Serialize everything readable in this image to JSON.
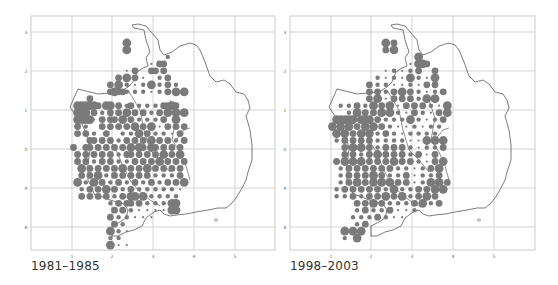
{
  "figure": {
    "panels": [
      {
        "id": "map-1981-1985",
        "caption": "1981–1985",
        "x_ticks": [
          "1",
          "2",
          "3",
          "4",
          "5"
        ],
        "y_ticks": [
          "3",
          "2",
          "1",
          "0",
          "9",
          "8"
        ]
      },
      {
        "id": "map-1998-2003",
        "caption": "1998–2003",
        "x_ticks": [
          "1",
          "2",
          "3",
          "4",
          "5"
        ],
        "y_ticks": [
          "3",
          "2",
          "1",
          "0",
          "9",
          "8"
        ]
      }
    ],
    "colors": {
      "dot": "#7a7a7a",
      "grid": "#c8c8c8",
      "outline": "#444444",
      "frame": "#bdbdbd",
      "tick_label": "#666666"
    },
    "legend_note": "Dot size indicates abundance class per grid square (0 none, 1 tiny, 2 small, 3 medium, 4 large)"
  },
  "chart_data": [
    {
      "type": "scatter",
      "title": "1981–1985",
      "xlabel": "",
      "ylabel": "",
      "x_ticks": [
        1,
        2,
        3,
        4,
        5
      ],
      "y_ticks": [
        "3",
        "2",
        "1",
        "0",
        "9",
        "8"
      ],
      "grid": true,
      "cell_size_px": 8.2,
      "origin_px": [
        53,
        36
      ],
      "rows": [
        "..................................",
        "..................4...............",
        "..................4...............",
        "............................2.....",
        "........................1.33......",
        "..................1.3...33.3......",
        "................3.4.3.1...2.3.....",
        "..............3.4.2.1.2.4.2.3.2...",
        "..............34332.2.2.1.2.3.4.4.",
        ".........3.........................",
        "......444443.44.3.23.2.2.2.3343...",
        "......444.3.2.3.3.4.3.3.2.3.4.4.4.",
        "......44441.3.33.4.3.2.2.2.3..4...",
        "......3.2...3.3.3.3.4.3.4.1.3.3.3.",
        "......3.3.2..3...2.2.4.3.2.2.1.3.",
        ".........33.3.3.2.3.3.3.4.3.3.2.3.",
        ".....3..33.3.3.3.3.4.43.43.3.3.3.",
        "......3.3.3.3.3.2.33.3.3.3.4.3.4.",
        "......3.3.2.3.3.2.2.3.3.3.4.3.3.3",
        ".......4.3.3.3.3.4.3.3.4.3.3.3.3.",
        ".......3.3.4.2.3.3.3.3.3.2.2.2.3.",
        "......4.2.4.3.2.3.2.3.2.3.2.3.3.4",
        ".......2.3.3.4.3.2.3.2.2.2.2.2.1.",
        ".......3.3.3.3.2.3.44.4.2.2.2.2.",
        "..............2.3.33.3.2.2.2.44.",
        "...............3.3.2.1.1.1.1.44.",
        "..............3.2.2.1.1.1.......",
        "...............3.2...............",
        "..............4.2.1..............",
        "..............2.2................",
        "..............4.1.1.............."
      ]
    },
    {
      "type": "scatter",
      "title": "1998–2003",
      "xlabel": "",
      "ylabel": "",
      "x_ticks": [
        1,
        2,
        3,
        4,
        5
      ],
      "y_ticks": [
        "3",
        "2",
        "1",
        "0",
        "9",
        "8"
      ],
      "grid": true,
      "cell_size_px": 8.2,
      "origin_px": [
        312,
        36
      ],
      "rows": [
        "..................................",
        "..................4.3.............",
        "..................3.4.............",
        "..........................4.......",
        "........................1.443.....",
        "..................1.2.1.2.3...3...",
        "................2.1.2.1.4.2.1.4...",
        "..............3.2.2.1.1.2.1.3.3...",
        "..............3.3.2.3.4.3.2.1.2.3.",
        "..............3.4.1.3.3.3.2.4.4...",
        ".......2.2.3.2.4.3.4.1.3.3.3.2.1.4.",
        ".........2.4.3.3.4.4.2.1.3.2.1.3.4",
        "......44444.444.3.2.2.2.4.2.1.2.3.",
        ".....4.4.4.3.4.4.3.2.1.1.2.1.2.2.",
        "......4.4.3.4.4.2.3.2.1.2.2.2.2.",
        "......2.3.3.3.3.2.2.2.2.1.1.4.4.4",
        "........3.4.4.3.2.3.3.3.2.1.2.2.3",
        "........3.3.2.3.4.3.3.3.2.3.1.3.",
        "......3.4.4.4.3.3.3.4.3.3.2.1.3.4",
        ".......2.3.3.3.3.3.3.2.2.1.2.3.4.",
        ".......2.3.3.3.4.3.2.2.3.1.2.2.3.",
        ".......2.3.4.3.4.4.4.3.3.1.2.4.4.3",
        "......2.3.3.3.3.3.2.4.2.2.3.3.4.4",
        "......2.2.3.2.3.3.4.3.4.2.3.4.3.",
        "...........3.3.4.3.2.2.2.3.4.2.3",
        "...........2.3.2.2.3.1.1.2......",
        "..........2.2.2.3.2.1.1.........",
        "...........2.3...................",
        "........4.4.4.....................",
        "........2..4......................",
        ".................................."
      ]
    }
  ]
}
